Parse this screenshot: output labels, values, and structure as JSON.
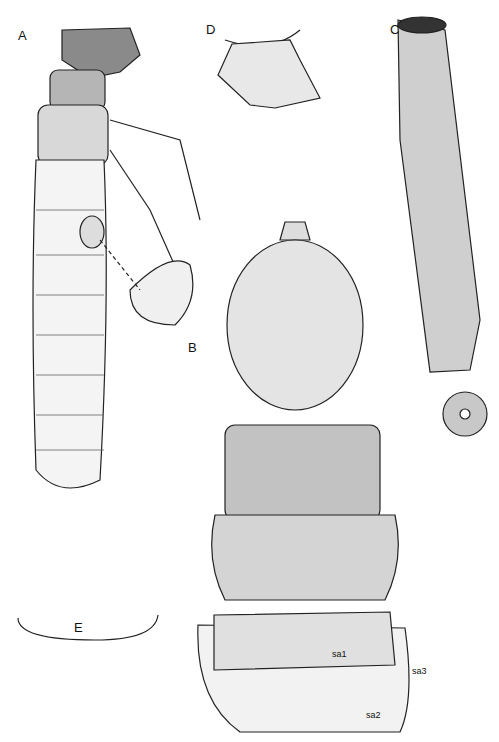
{
  "figure": {
    "panels": [
      {
        "id": "A",
        "label": "A",
        "description": "larva lateral view"
      },
      {
        "id": "B",
        "label": "B",
        "description": "head and thoracic nota dorsal view"
      },
      {
        "id": "C",
        "label": "C",
        "description": "larval case"
      },
      {
        "id": "D",
        "label": "D",
        "description": "detail"
      },
      {
        "id": "E",
        "label": "E",
        "description": "setal fringe"
      }
    ],
    "annotations": [
      "sa1",
      "sa2",
      "sa3"
    ]
  }
}
